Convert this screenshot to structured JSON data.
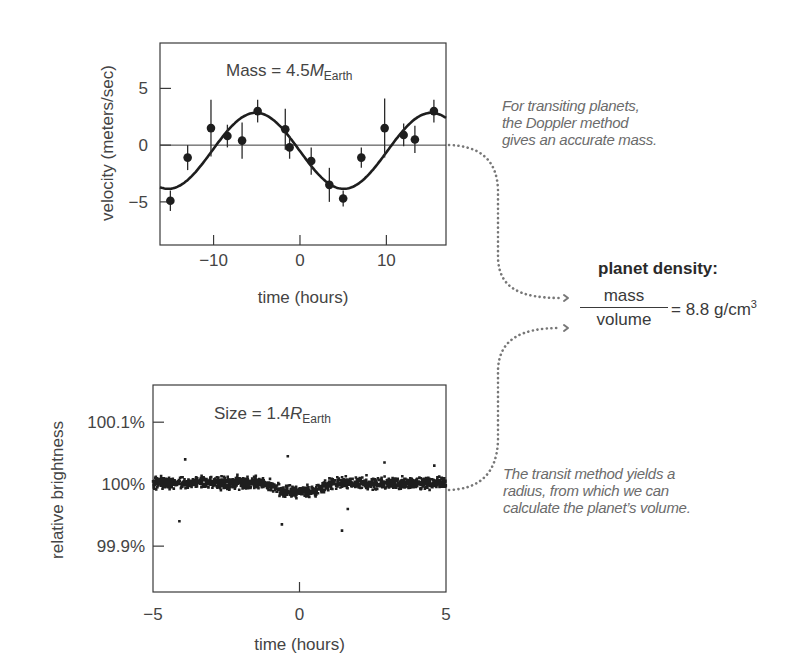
{
  "chart_data": [
    {
      "id": "doppler",
      "type": "scatter",
      "title": "Mass = 4.5 M_Earth",
      "annotation": {
        "prefix": "Mass = 4.5",
        "symbol": "M",
        "subscript": "Earth"
      },
      "xlabel": "time (hours)",
      "ylabel": "velocity (meters/sec)",
      "xlim": [
        -16.2,
        16.9
      ],
      "ylim": [
        -8.8,
        9.0
      ],
      "xticks": [
        -10,
        0,
        10
      ],
      "xtick_labels": [
        "−10",
        "0",
        "10"
      ],
      "yticks": [
        5,
        0,
        -5
      ],
      "ytick_labels": [
        "5",
        "0",
        "−5"
      ],
      "grid": false,
      "zero_line": true,
      "series": [
        {
          "name": "measured radial velocity",
          "x": [
            -15.0,
            -13.0,
            -10.3,
            -8.4,
            -6.7,
            -4.9,
            -1.7,
            -1.2,
            1.3,
            3.4,
            5.0,
            7.1,
            9.8,
            12.0,
            13.3,
            15.5
          ],
          "y": [
            -4.9,
            -1.1,
            1.5,
            0.8,
            0.4,
            3.0,
            1.4,
            -0.2,
            -1.4,
            -3.5,
            -4.7,
            -1.1,
            1.5,
            0.9,
            0.5,
            3.0
          ],
          "yerr": [
            0.9,
            1.1,
            2.5,
            1.0,
            1.6,
            1.0,
            1.8,
            1.0,
            1.2,
            1.5,
            0.7,
            0.9,
            2.6,
            1.0,
            1.2,
            1.0
          ]
        },
        {
          "name": "sinusoidal fit",
          "kind": "line",
          "model": {
            "offset": -0.5,
            "amplitude": 3.35,
            "period_hours": 20.3,
            "peak_time_hours": -5.1
          }
        }
      ]
    },
    {
      "id": "transit",
      "type": "scatter",
      "title": "Size = 1.4 R_Earth",
      "annotation": {
        "prefix": "Size = 1.4",
        "symbol": "R",
        "subscript": "Earth"
      },
      "xlabel": "time (hours)",
      "ylabel": "relative brightness",
      "xlim": [
        -5,
        5
      ],
      "ylim": [
        99.826,
        100.16
      ],
      "xticks": [
        0
      ],
      "xtick_labels_at": [
        -5,
        0,
        5
      ],
      "xtick_labels": [
        "−5",
        "0",
        "5"
      ],
      "yticks": [
        100.1,
        100.0,
        99.9
      ],
      "ytick_labels": [
        "100.1%",
        "100%",
        "99.9%"
      ],
      "grid": false,
      "series": [
        {
          "name": "photometry points",
          "baseline_percent": 100.002,
          "transit_depth_percent": 0.014,
          "transit_ingress_hours": [
            -1.2,
            -0.6
          ],
          "transit_egress_hours": [
            0.5,
            1.1
          ],
          "scatter_percent": 0.008,
          "n_points": 1500,
          "outliers": [
            [
              -4.1,
              99.94
            ],
            [
              -3.9,
              100.04
            ],
            [
              -0.6,
              99.935
            ],
            [
              -0.4,
              100.045
            ],
            [
              1.45,
              99.925
            ],
            [
              1.65,
              99.96
            ],
            [
              2.9,
              100.035
            ],
            [
              4.6,
              100.03
            ]
          ]
        }
      ]
    }
  ],
  "annotations": {
    "doppler_note": [
      "For transiting planets,",
      "the Doppler method",
      "gives an accurate mass."
    ],
    "transit_note": [
      "The transit method yields a",
      "radius, from which we can",
      "calculate the planet’s volume."
    ]
  },
  "density": {
    "title": "planet density:",
    "numerator": "mass",
    "denominator": "volume",
    "result": "= 8.8 g/cm",
    "result_exponent": "3"
  },
  "colors": {
    "ink": "#2b2b2b",
    "axis": "#3a3a3a",
    "text": "#444444",
    "annotation": "#6b6b6b",
    "dotted": "#777777"
  }
}
